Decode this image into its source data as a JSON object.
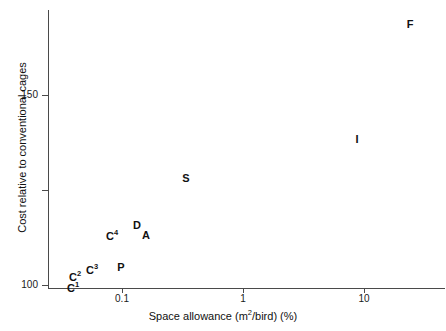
{
  "chart_data": {
    "type": "scatter",
    "title": "",
    "xlabel": "Space allowance (m2/bird) (%)",
    "ylabel": "Cost relative to conventional cages",
    "xscale": "log",
    "yscale": "linear",
    "xlim": [
      0.034,
      33
    ],
    "ylim": [
      99.2,
      173
    ],
    "grid": false,
    "legend": null,
    "x_ticks": [
      {
        "value": 0.1,
        "label": "0.1",
        "px": 122
      },
      {
        "value": 1,
        "label": "1",
        "px": 243
      },
      {
        "value": 10,
        "label": "10",
        "px": 364
      }
    ],
    "y_ticks": [
      {
        "value": 100,
        "label": "100",
        "px": 285
      },
      {
        "value": 125,
        "label": "",
        "px": 190
      },
      {
        "value": 150,
        "label": "150",
        "px": 95
      }
    ],
    "point_style": "text-marker",
    "points": [
      {
        "label": "C",
        "sup": "1",
        "x": 0.041,
        "y": 100.5,
        "px": 73,
        "py": 288
      },
      {
        "label": "C",
        "sup": "2",
        "x": 0.043,
        "y": 103.0,
        "px": 75,
        "py": 277
      },
      {
        "label": "C",
        "sup": "3",
        "x": 0.055,
        "y": 104.0,
        "px": 92,
        "py": 270
      },
      {
        "label": "P",
        "sup": "",
        "x": 0.083,
        "y": 105.5,
        "px": 121,
        "py": 267
      },
      {
        "label": "C",
        "sup": "4",
        "x": 0.073,
        "y": 113.0,
        "px": 112,
        "py": 236
      },
      {
        "label": "D",
        "sup": "",
        "x": 0.11,
        "y": 116.0,
        "px": 137,
        "py": 225
      },
      {
        "label": "A",
        "sup": "",
        "x": 0.13,
        "y": 113.5,
        "px": 146,
        "py": 235
      },
      {
        "label": "S",
        "sup": "",
        "x": 0.21,
        "y": 129.0,
        "px": 186,
        "py": 178
      },
      {
        "label": "I",
        "sup": "",
        "x": 7.5,
        "y": 139.0,
        "px": 357,
        "py": 139
      },
      {
        "label": "F",
        "sup": "",
        "x": 17.0,
        "y": 169.0,
        "px": 410,
        "py": 24
      }
    ]
  },
  "axis_titles": {
    "x_prefix": "Space allowance (m",
    "x_sup": "2",
    "x_suffix": "/bird) (%)",
    "y": "Cost relative to conventional cages"
  },
  "colors": {
    "axis": "#4a4a4a",
    "text": "#111111",
    "background": "#ffffff"
  }
}
